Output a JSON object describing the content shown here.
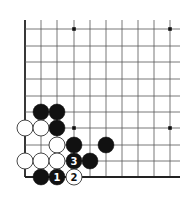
{
  "diagram": {
    "colors": {
      "background": "#ffffff",
      "line": "#555555",
      "edge": "#222222",
      "black_stone": "#111111",
      "white_stone": "#ffffff",
      "white_stone_border": "#333333",
      "hoshi": "#111111"
    },
    "grid": {
      "columns_x": [
        25,
        41,
        57,
        74,
        90,
        106,
        122,
        138,
        154,
        170
      ],
      "rows_y": [
        29,
        46,
        62,
        79,
        96,
        112,
        128,
        145,
        161,
        177
      ],
      "left_edge": true,
      "bottom_edge": true,
      "open_top_extend_to": 20,
      "open_right_extend_to": 180
    },
    "hoshi": [
      {
        "col": 3,
        "row": 0
      },
      {
        "col": 9,
        "row": 0
      },
      {
        "col": 3,
        "row": 6
      },
      {
        "col": 9,
        "row": 6
      }
    ],
    "stones": [
      {
        "color": "black",
        "col": 1,
        "row": 5,
        "label": ""
      },
      {
        "color": "black",
        "col": 2,
        "row": 5,
        "label": ""
      },
      {
        "color": "white",
        "col": 0,
        "row": 6,
        "label": ""
      },
      {
        "color": "white",
        "col": 1,
        "row": 6,
        "label": ""
      },
      {
        "color": "black",
        "col": 2,
        "row": 6,
        "label": ""
      },
      {
        "color": "white",
        "col": 2,
        "row": 7,
        "label": ""
      },
      {
        "color": "black",
        "col": 3,
        "row": 7,
        "label": ""
      },
      {
        "color": "black",
        "col": 5,
        "row": 7,
        "label": ""
      },
      {
        "color": "white",
        "col": 0,
        "row": 8,
        "label": ""
      },
      {
        "color": "white",
        "col": 1,
        "row": 8,
        "label": ""
      },
      {
        "color": "white",
        "col": 2,
        "row": 8,
        "label": ""
      },
      {
        "color": "black",
        "col": 3,
        "row": 8,
        "label": "3"
      },
      {
        "color": "black",
        "col": 4,
        "row": 8,
        "label": ""
      },
      {
        "color": "black",
        "col": 1,
        "row": 9,
        "label": ""
      },
      {
        "color": "black",
        "col": 2,
        "row": 9,
        "label": "1"
      },
      {
        "color": "white",
        "col": 3,
        "row": 9,
        "label": "2"
      }
    ]
  }
}
